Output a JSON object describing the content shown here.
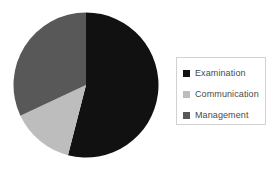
{
  "chart_data": {
    "type": "pie",
    "title": "",
    "subtitle": "",
    "xlabel": "",
    "ylabel": "",
    "grid": false,
    "legend_position": "right",
    "start_angle_deg": 0,
    "direction": "clockwise",
    "categories": [
      "Examination",
      "Communication",
      "Management"
    ],
    "values": [
      54,
      14,
      32
    ],
    "value_unit": "%",
    "colors": [
      "#111111",
      "#bdbdbd",
      "#585858"
    ],
    "slices": [
      {
        "label": "Examination",
        "value": 54,
        "color": "#111111",
        "start_deg": 0,
        "end_deg": 194.4
      },
      {
        "label": "Communication",
        "value": 14,
        "color": "#bdbdbd",
        "start_deg": 194.4,
        "end_deg": 244.8
      },
      {
        "label": "Management",
        "value": 32,
        "color": "#585858",
        "start_deg": 244.8,
        "end_deg": 360
      }
    ],
    "annotations": []
  },
  "legend": {
    "border_color": "#d2d2d2",
    "background": "#ffffff",
    "items": [
      {
        "label": "Examination",
        "swatch_name": "legend-swatch-examination",
        "color": "#111111"
      },
      {
        "label": "Communication",
        "swatch_name": "legend-swatch-communication",
        "color": "#bdbdbd"
      },
      {
        "label": "Management",
        "swatch_name": "legend-swatch-management",
        "color": "#585858"
      }
    ]
  },
  "canvas": {
    "background": "#ffffff",
    "width": 279,
    "height": 171
  }
}
